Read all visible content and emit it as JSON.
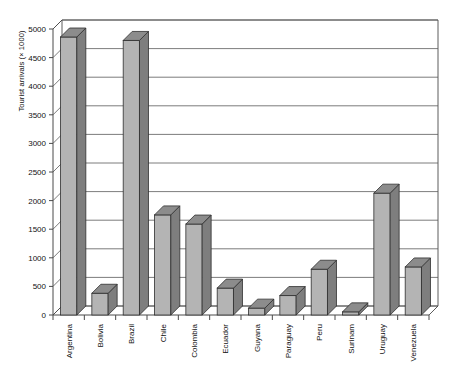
{
  "chart_data": {
    "type": "bar",
    "title": "",
    "subtitle": "",
    "xlabel": "",
    "ylabel": "Tourist arrivals (× 1000)",
    "ylim": [
      0,
      5000
    ],
    "ytick_step": 500,
    "yticks": [
      0,
      500,
      1000,
      1500,
      2000,
      2500,
      3000,
      3500,
      4000,
      4500,
      5000
    ],
    "ytick_labels": [
      "0",
      "500",
      "1000",
      "1500",
      "2000",
      "2500",
      "3000",
      "3500",
      "4000",
      "4500",
      "5000"
    ],
    "grid": true,
    "grid_axis": "y",
    "legend": false,
    "legend_position": "none",
    "style": "3d-column",
    "categories": [
      "Argentina",
      "Bolivia",
      "Brazil",
      "Chile",
      "Colombia",
      "Ecuador",
      "Guyana",
      "Paraguay",
      "Peru",
      "Surinam",
      "Uruguay",
      "Venezuela"
    ],
    "values": [
      4860,
      380,
      4800,
      1750,
      1590,
      470,
      120,
      340,
      800,
      55,
      2130,
      840
    ],
    "series": [
      {
        "name": "Tourist arrivals",
        "values": [
          4860,
          380,
          4800,
          1750,
          1590,
          470,
          120,
          340,
          800,
          55,
          2130,
          840
        ]
      }
    ]
  },
  "colors": {
    "bar_front": "#b4b4b4",
    "bar_side": "#7e7e7e",
    "bar_top": "#8c8c8c",
    "bar_outline": "#2e2e2e",
    "grid": "#5a5a5a",
    "axis": "#4a4a4a",
    "background": "#ffffff",
    "text": "#111111"
  }
}
